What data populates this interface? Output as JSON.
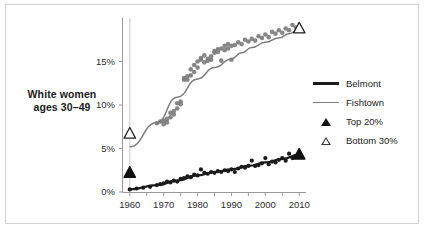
{
  "figure": {
    "row_label_line1": "White women",
    "row_label_line2": "ages 30–49",
    "border_color": "#d2d2d2",
    "background": "#ffffff"
  },
  "legend": {
    "position": "right",
    "items": [
      {
        "key": "line-belmont",
        "label": "Belmont",
        "color": "#1a1a1a"
      },
      {
        "key": "line-fishtown",
        "label": "Fishtown",
        "color": "#7d7d7d"
      },
      {
        "key": "triangle-filled",
        "label": "Top 20%",
        "color": "#111111"
      },
      {
        "key": "triangle-open",
        "label": "Bottom 30%",
        "color": "#3a3a3a"
      }
    ]
  },
  "axis": {
    "x_ticks": [
      "1960",
      "1970",
      "1980",
      "1990",
      "2000",
      "2010"
    ],
    "y_ticks": [
      "0%",
      "5%",
      "10%",
      "15%"
    ],
    "x_minor_step_years": 5
  },
  "chart_data": {
    "type": "scatter",
    "title": "",
    "subtitle": "",
    "xlabel": "",
    "ylabel": "",
    "xlim": [
      1958,
      2012
    ],
    "ylim": [
      0,
      20
    ],
    "grid": false,
    "legend_position": "right",
    "axis_ticks_x": [
      1960,
      1970,
      1980,
      1990,
      2000,
      2010
    ],
    "axis_ticks_y": [
      0,
      5,
      10,
      15
    ],
    "annotations": [
      {
        "name": "bottom-30-1960-marker",
        "x": 1960,
        "y": 6.7,
        "marker": "triangle-open",
        "series": "Fishtown"
      },
      {
        "name": "bottom-30-2010-marker",
        "x": 2010,
        "y": 18.8,
        "marker": "triangle-open",
        "series": "Fishtown"
      },
      {
        "name": "top-20-1960-marker",
        "x": 1960,
        "y": 2.2,
        "marker": "triangle-filled",
        "series": "Belmont"
      },
      {
        "name": "top-20-2010-marker",
        "x": 2010,
        "y": 4.3,
        "marker": "triangle-filled",
        "series": "Belmont"
      }
    ],
    "series": [
      {
        "name": "Fishtown",
        "style": "scatter+trendline",
        "color": "#7d7d7d",
        "x": [
          1968,
          1969,
          1970,
          1970,
          1971,
          1971,
          1972,
          1972,
          1973,
          1973,
          1974,
          1974,
          1975,
          1975,
          1976,
          1976,
          1977,
          1977,
          1978,
          1978,
          1979,
          1979,
          1980,
          1980,
          1981,
          1981,
          1982,
          1982,
          1983,
          1983,
          1984,
          1984,
          1985,
          1985,
          1986,
          1986,
          1987,
          1987,
          1988,
          1988,
          1989,
          1989,
          1990,
          1990,
          1991,
          1992,
          1993,
          1994,
          1995,
          1996,
          1997,
          1998,
          1999,
          2000,
          2001,
          2002,
          2003,
          2004,
          2005,
          2006,
          2007,
          2008,
          2009,
          2010
        ],
        "y": [
          7.9,
          8.1,
          8.2,
          7.8,
          8.4,
          8.0,
          8.6,
          9.1,
          8.9,
          9.3,
          9.6,
          10.2,
          10.4,
          10.1,
          12.9,
          13.1,
          13.3,
          12.9,
          13.4,
          14.1,
          13.8,
          14.6,
          14.3,
          15.0,
          15.4,
          15.2,
          15.7,
          14.9,
          15.1,
          15.3,
          15.2,
          15.6,
          16.2,
          16.0,
          16.4,
          16.1,
          16.5,
          15.1,
          16.3,
          16.8,
          16.5,
          17.0,
          16.8,
          15.2,
          16.9,
          17.2,
          17.0,
          17.5,
          17.3,
          17.6,
          17.4,
          17.9,
          17.7,
          18.1,
          17.8,
          18.4,
          18.2,
          18.6,
          18.3,
          18.8,
          18.6,
          19.2,
          18.9,
          18.8
        ],
        "trendline_y": [
          5.2,
          8.0,
          10.9,
          13.0,
          14.3,
          15.3,
          16.0,
          16.6,
          17.2,
          17.7,
          18.2,
          18.7
        ],
        "trendline_x": [
          1960,
          1968,
          1974,
          1980,
          1985,
          1990,
          1993,
          1996,
          2000,
          2004,
          2007,
          2010
        ]
      },
      {
        "name": "Belmont",
        "style": "scatter+trendline",
        "color": "#1a1a1a",
        "x": [
          1960,
          1962,
          1964,
          1966,
          1968,
          1969,
          1970,
          1971,
          1972,
          1973,
          1974,
          1975,
          1976,
          1977,
          1978,
          1979,
          1980,
          1981,
          1982,
          1983,
          1984,
          1985,
          1986,
          1987,
          1988,
          1989,
          1990,
          1991,
          1992,
          1993,
          1994,
          1995,
          1996,
          1997,
          1998,
          1999,
          2000,
          2001,
          2002,
          2003,
          2004,
          2005,
          2006,
          2007,
          2008,
          2009,
          2010
        ],
        "y": [
          0.3,
          0.4,
          0.5,
          0.6,
          0.8,
          0.9,
          1.0,
          1.2,
          1.1,
          1.3,
          1.2,
          1.5,
          1.6,
          1.8,
          1.7,
          2.0,
          1.9,
          2.6,
          2.2,
          2.1,
          2.3,
          2.2,
          2.4,
          2.3,
          2.5,
          2.4,
          2.6,
          2.3,
          2.7,
          2.9,
          2.8,
          3.0,
          3.6,
          3.0,
          3.1,
          3.3,
          3.9,
          3.2,
          3.5,
          3.4,
          3.7,
          3.9,
          3.6,
          4.4,
          3.9,
          4.1,
          4.3
        ],
        "trendline_y": [
          0.3,
          0.8,
          1.3,
          1.9,
          2.3,
          2.6,
          3.0,
          3.4,
          3.8,
          4.3
        ],
        "trendline_x": [
          1960,
          1968,
          1974,
          1980,
          1985,
          1990,
          1995,
          2000,
          2005,
          2010
        ]
      }
    ]
  }
}
